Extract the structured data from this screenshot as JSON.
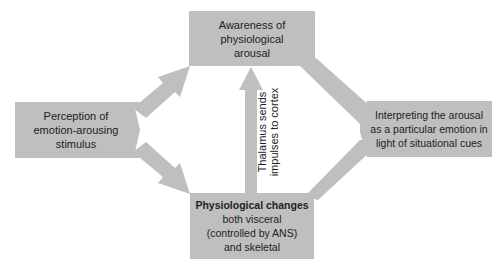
{
  "diagram": {
    "box_color": "#bfbfbf",
    "text_color": "#222222",
    "nodes": {
      "awareness": {
        "lines": [
          "Awareness of",
          "physiological",
          "arousal"
        ]
      },
      "perception": {
        "lines": [
          "Perception of",
          "emotion-arousing",
          "stimulus"
        ]
      },
      "interpreting": {
        "lines": [
          "Interpreting the arousal",
          "as a particular emotion in",
          "light of situational cues"
        ]
      },
      "physiological": {
        "title": "Physiological changes",
        "lines": [
          "both visceral",
          "(controlled by ANS)",
          "and skeletal"
        ]
      }
    },
    "edge_labels": {
      "thalamus": {
        "lines": [
          "Thalamus sends",
          "impulses to cortex"
        ]
      }
    },
    "edges": [
      {
        "from": "perception",
        "to": "awareness"
      },
      {
        "from": "perception",
        "to": "physiological"
      },
      {
        "from": "physiological",
        "to": "awareness",
        "label": "thalamus"
      },
      {
        "from": "awareness",
        "to": "interpreting"
      },
      {
        "from": "physiological",
        "to": "interpreting"
      }
    ]
  }
}
